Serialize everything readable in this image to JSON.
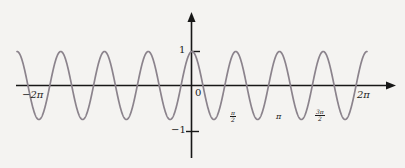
{
  "figure": {
    "title": "",
    "background_color": "#f4f3f1",
    "axis_color": "#171717",
    "curve_color": "#8b838c"
  },
  "axes": {
    "x_axis_name": "x-axis",
    "y_axis_name": "y-axis",
    "origin_label": "0",
    "left_label": "−2π",
    "right_label": "2π",
    "y_tick_top": "1",
    "y_tick_bottom": "−1",
    "pi_label": "π",
    "half_pi_num": "π",
    "half_pi_den": "2",
    "three_half_pi_num": "3π",
    "three_half_pi_den": "2"
  },
  "chart_data": {
    "type": "line",
    "title": "",
    "xlabel": "",
    "ylabel": "",
    "function": "y = cos(4x)",
    "amplitude": 1,
    "period": "π/2",
    "cycles_visible": 8,
    "xlim": [
      -6.283185307,
      6.283185307
    ],
    "ylim": [
      -1,
      1
    ],
    "grid": false,
    "legend": null,
    "x_tick_labels": [
      "−2π",
      "0",
      "π/2",
      "π",
      "3π/2",
      "2π"
    ],
    "x_tick_values": [
      -6.283185307,
      0,
      1.570796327,
      3.141592654,
      4.71238898,
      6.283185307
    ],
    "y_tick_labels": [
      "1",
      "−1"
    ],
    "y_tick_values": [
      1,
      -1
    ],
    "series": [
      {
        "name": "cos(4x)",
        "color": "#8b838c",
        "x": [
          -6.2832,
          -6.0868,
          -5.8905,
          -5.6941,
          -5.4978,
          -5.3014,
          -5.1051,
          -4.9087,
          -4.7124,
          -4.516,
          -4.3197,
          -4.1233,
          -3.927,
          -3.7306,
          -3.5343,
          -3.3379,
          -3.1416,
          -2.9452,
          -2.7489,
          -2.5525,
          -2.3562,
          -2.1598,
          -1.9635,
          -1.7671,
          -1.5708,
          -1.3744,
          -1.1781,
          -0.9817,
          -0.7854,
          -0.589,
          -0.3927,
          -0.1963,
          0,
          0.1963,
          0.3927,
          0.589,
          0.7854,
          0.9817,
          1.1781,
          1.3744,
          1.5708,
          1.7671,
          1.9635,
          2.1598,
          2.3562,
          2.5525,
          2.7489,
          2.9452,
          3.1416,
          3.3379,
          3.5343,
          3.7306,
          3.927,
          4.1233,
          4.3197,
          4.516,
          4.7124,
          4.9087,
          5.1051,
          5.3014,
          5.4978,
          5.6941,
          5.8905,
          6.0868,
          6.2832
        ],
        "y": [
          1,
          0.7071,
          0,
          -0.7071,
          -1,
          -0.7071,
          0,
          0.7071,
          1,
          0.7071,
          0,
          -0.7071,
          -1,
          -0.7071,
          0,
          0.7071,
          1,
          0.7071,
          0,
          -0.7071,
          -1,
          -0.7071,
          0,
          0.7071,
          1,
          0.7071,
          0,
          -0.7071,
          -1,
          -0.7071,
          0,
          0.7071,
          1,
          0.7071,
          0,
          -0.7071,
          -1,
          -0.7071,
          0,
          0.7071,
          1,
          0.7071,
          0,
          -0.7071,
          -1,
          -0.7071,
          0,
          0.7071,
          1,
          0.7071,
          0,
          -0.7071,
          -1,
          -0.7071,
          0,
          0.7071,
          1,
          0.7071,
          0,
          -0.7071,
          -1,
          -0.7071,
          0,
          0.7071,
          1
        ]
      }
    ]
  }
}
